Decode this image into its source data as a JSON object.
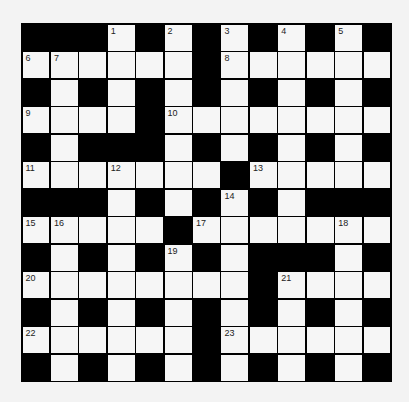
{
  "puzzle": {
    "type": "crossword",
    "rows": 13,
    "cols": 13,
    "colors": {
      "block": "#000000",
      "cell": "#f6f6f6",
      "number": "#222222",
      "background": "#f3f3f3"
    },
    "grid": [
      "###W#W#W#W#W#",
      "WWWWWW#WWWWWW",
      "#W#W#W#W#W#W#",
      "WWWW#WWWWWWWW",
      "#W###W#W#W#W#",
      "WWWWWWW#WWWWW",
      "###W#W#W#W###",
      "WWWWW#WWWWWWW",
      "#W#W#W#W###W#",
      "WWWWWWWW#WWWW",
      "#W#W#W#W#W#W#",
      "WWWWWW#WWWWWW",
      "#W#W#W#W#W#W#"
    ],
    "numbers": [
      {
        "row": 0,
        "col": 3,
        "num": "1"
      },
      {
        "row": 0,
        "col": 5,
        "num": "2"
      },
      {
        "row": 0,
        "col": 7,
        "num": "3"
      },
      {
        "row": 0,
        "col": 9,
        "num": "4"
      },
      {
        "row": 0,
        "col": 11,
        "num": "5"
      },
      {
        "row": 1,
        "col": 0,
        "num": "6"
      },
      {
        "row": 1,
        "col": 1,
        "num": "7"
      },
      {
        "row": 1,
        "col": 7,
        "num": "8"
      },
      {
        "row": 3,
        "col": 0,
        "num": "9"
      },
      {
        "row": 3,
        "col": 5,
        "num": "10"
      },
      {
        "row": 5,
        "col": 0,
        "num": "11"
      },
      {
        "row": 5,
        "col": 3,
        "num": "12"
      },
      {
        "row": 5,
        "col": 8,
        "num": "13"
      },
      {
        "row": 6,
        "col": 7,
        "num": "14"
      },
      {
        "row": 7,
        "col": 0,
        "num": "15"
      },
      {
        "row": 7,
        "col": 1,
        "num": "16"
      },
      {
        "row": 7,
        "col": 6,
        "num": "17"
      },
      {
        "row": 7,
        "col": 11,
        "num": "18"
      },
      {
        "row": 8,
        "col": 5,
        "num": "19"
      },
      {
        "row": 9,
        "col": 0,
        "num": "20"
      },
      {
        "row": 9,
        "col": 9,
        "num": "21"
      },
      {
        "row": 11,
        "col": 0,
        "num": "22"
      },
      {
        "row": 11,
        "col": 7,
        "num": "23"
      }
    ]
  }
}
